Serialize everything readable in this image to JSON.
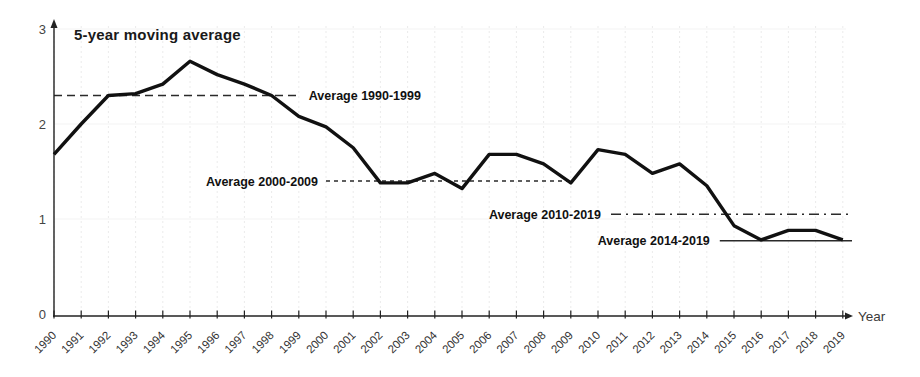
{
  "chart_data": {
    "type": "line",
    "title": "5-year moving average",
    "xlabel": "Year",
    "ylabel": "",
    "ylim": [
      0,
      3
    ],
    "yticks": [
      0,
      1,
      2,
      3
    ],
    "grid": "faint vertical per year",
    "x": [
      "1990",
      "1991",
      "1992",
      "1993",
      "1994",
      "1995",
      "1996",
      "1997",
      "1998",
      "1999",
      "2000",
      "2001",
      "2002",
      "2003",
      "2004",
      "2005",
      "2006",
      "2007",
      "2008",
      "2009",
      "2010",
      "2011",
      "2012",
      "2013",
      "2014",
      "2015",
      "2016",
      "2017",
      "2018",
      "2019"
    ],
    "series": [
      {
        "name": "5-year moving average",
        "values": [
          1.68,
          2.0,
          2.3,
          2.32,
          2.42,
          2.66,
          2.52,
          2.42,
          2.3,
          2.08,
          1.97,
          1.75,
          1.38,
          1.38,
          1.48,
          1.32,
          1.68,
          1.68,
          1.58,
          1.38,
          1.73,
          1.68,
          1.48,
          1.58,
          1.35,
          0.93,
          0.78,
          0.88,
          0.88,
          0.78
        ]
      }
    ],
    "annotations": [
      {
        "label": "Average 1990-1999",
        "value": 2.3,
        "from_year": "1990",
        "to_year": "1999",
        "line_style": "dashed",
        "label_side": "right"
      },
      {
        "label": "Average 2000-2009",
        "value": 1.4,
        "from_year": "2000",
        "to_year": "2009",
        "line_style": "dashed-fine",
        "label_side": "left"
      },
      {
        "label": "Average 2010-2019",
        "value": 1.05,
        "from_year": "2010",
        "to_year": "2019",
        "line_style": "dash-dot",
        "label_side": "left-overlap"
      },
      {
        "label": "Average 2014-2019",
        "value": 0.77,
        "from_year": "2014",
        "to_year": "2019",
        "line_style": "solid",
        "label_side": "left-overlap"
      }
    ],
    "colors": {
      "line": "#111111",
      "axis": "#222222",
      "annotation_line": "#2a2a2a",
      "annotation_text": "#111111",
      "tick_text": "#333333",
      "grid": "#ebebeb",
      "grid_h": "#f3f3f3",
      "background": "#ffffff"
    }
  }
}
